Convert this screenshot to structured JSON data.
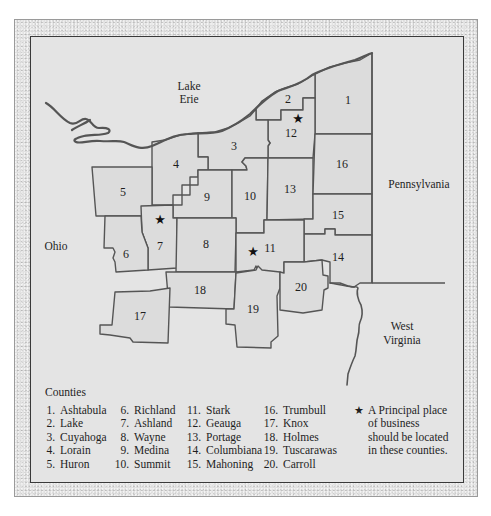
{
  "map": {
    "labels": {
      "lake": "Lake\nErie",
      "lake_line1": "Lake",
      "lake_line2": "Erie",
      "ohio": "Ohio",
      "pennsylvania": "Pennsylvania",
      "wv_line1": "West",
      "wv_line2": "Virginia"
    },
    "counties": [
      {
        "num": "1"
      },
      {
        "num": "2"
      },
      {
        "num": "3"
      },
      {
        "num": "4"
      },
      {
        "num": "5"
      },
      {
        "num": "6"
      },
      {
        "num": "7"
      },
      {
        "num": "8"
      },
      {
        "num": "9"
      },
      {
        "num": "10"
      },
      {
        "num": "11"
      },
      {
        "num": "12"
      },
      {
        "num": "13"
      },
      {
        "num": "14"
      },
      {
        "num": "15"
      },
      {
        "num": "16"
      },
      {
        "num": "17"
      },
      {
        "num": "18"
      },
      {
        "num": "19"
      },
      {
        "num": "20"
      }
    ],
    "starred_counties": [
      "7",
      "11",
      "12"
    ],
    "star_glyph": "★"
  },
  "legend": {
    "title": "Counties",
    "columns": [
      [
        {
          "n": "1.",
          "name": "Ashtabula"
        },
        {
          "n": "2.",
          "name": "Lake"
        },
        {
          "n": "3.",
          "name": "Cuyahoga"
        },
        {
          "n": "4.",
          "name": "Lorain"
        },
        {
          "n": "5.",
          "name": "Huron"
        }
      ],
      [
        {
          "n": "6.",
          "name": "Richland"
        },
        {
          "n": "7.",
          "name": "Ashland"
        },
        {
          "n": "8.",
          "name": "Wayne"
        },
        {
          "n": "9.",
          "name": "Medina"
        },
        {
          "n": "10.",
          "name": "Summit"
        }
      ],
      [
        {
          "n": "11.",
          "name": "Stark"
        },
        {
          "n": "12.",
          "name": "Geauga"
        },
        {
          "n": "13.",
          "name": "Portage"
        },
        {
          "n": "14.",
          "name": "Columbiana"
        },
        {
          "n": "15.",
          "name": "Mahoning"
        }
      ],
      [
        {
          "n": "16.",
          "name": "Trumbull"
        },
        {
          "n": "17.",
          "name": "Knox"
        },
        {
          "n": "18.",
          "name": "Holmes"
        },
        {
          "n": "19.",
          "name": "Tuscarawas"
        },
        {
          "n": "20.",
          "name": "Carroll"
        }
      ]
    ],
    "note_star": "★",
    "note": "A Principal place\nof business\nshould be located\nin these counties."
  }
}
